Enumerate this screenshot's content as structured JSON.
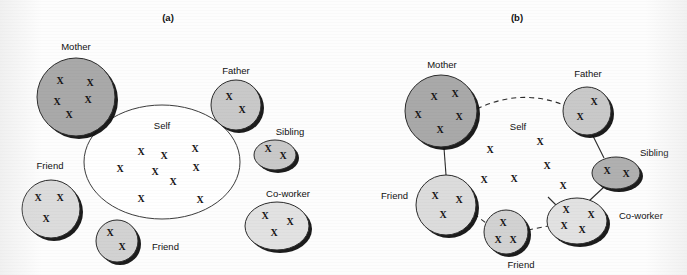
{
  "figure": {
    "panels": [
      {
        "id": "a",
        "title": "(a)",
        "title_pos": {
          "x": 168,
          "y": 21
        },
        "self": {
          "label": "Self",
          "label_pos": {
            "x": 162,
            "y": 129
          },
          "shape": "ellipse",
          "cx": 162,
          "cy": 162,
          "rx": 78,
          "ry": 57,
          "fill": "#ffffff",
          "stroke": "#3c3c3c",
          "x_marks": [
            {
              "x": 141,
              "y": 155
            },
            {
              "x": 164,
              "y": 159
            },
            {
              "x": 195,
              "y": 152
            },
            {
              "x": 120,
              "y": 172
            },
            {
              "x": 155,
              "y": 175
            },
            {
              "x": 196,
              "y": 171
            },
            {
              "x": 173,
              "y": 185
            },
            {
              "x": 141,
              "y": 202
            },
            {
              "x": 200,
              "y": 203
            }
          ]
        },
        "nodes": [
          {
            "name": "mother",
            "label": "Mother",
            "label_pos": {
              "x": 76,
              "y": 50
            },
            "anchor": "middle",
            "shape": "circle",
            "cx": 76,
            "cy": 97,
            "r": 39,
            "fill": "#a9a9a9",
            "stroke": "#2b2b2b",
            "x_marks": [
              {
                "x": 60,
                "y": 84
              },
              {
                "x": 90,
                "y": 86
              },
              {
                "x": 57,
                "y": 105
              },
              {
                "x": 88,
                "y": 103
              },
              {
                "x": 69,
                "y": 118
              }
            ]
          },
          {
            "name": "father",
            "label": "Father",
            "label_pos": {
              "x": 236,
              "y": 74
            },
            "anchor": "middle",
            "shape": "circle",
            "cx": 236,
            "cy": 105,
            "r": 25,
            "fill": "#c9c9c9",
            "stroke": "#2b2b2b",
            "x_marks": [
              {
                "x": 229,
                "y": 100
              },
              {
                "x": 242,
                "y": 113
              }
            ]
          },
          {
            "name": "sibling",
            "label": "Sibling",
            "label_pos": {
              "x": 290,
              "y": 135
            },
            "anchor": "middle",
            "shape": "ellipse",
            "cx": 275,
            "cy": 155,
            "rx": 21,
            "ry": 15,
            "fill": "#c9c9c9",
            "stroke": "#2b2b2b",
            "x_marks": [
              {
                "x": 268,
                "y": 152
              },
              {
                "x": 283,
                "y": 159
              }
            ]
          },
          {
            "name": "friend-left",
            "label": "Friend",
            "label_pos": {
              "x": 50,
              "y": 169
            },
            "anchor": "middle",
            "shape": "circle",
            "cx": 51,
            "cy": 209,
            "r": 29,
            "fill": "#dcdcdc",
            "stroke": "#2b2b2b",
            "x_marks": [
              {
                "x": 38,
                "y": 201
              },
              {
                "x": 60,
                "y": 201
              },
              {
                "x": 46,
                "y": 222
              }
            ]
          },
          {
            "name": "friend-bottom",
            "label": "Friend",
            "label_pos": {
              "x": 152,
              "y": 250
            },
            "anchor": "start",
            "shape": "circle",
            "cx": 117,
            "cy": 241,
            "r": 21,
            "fill": "#d2d2d2",
            "stroke": "#2b2b2b",
            "x_marks": [
              {
                "x": 110,
                "y": 236
              },
              {
                "x": 122,
                "y": 250
              }
            ]
          },
          {
            "name": "co-worker",
            "label": "Co-worker",
            "label_pos": {
              "x": 288,
              "y": 197
            },
            "anchor": "middle",
            "shape": "ellipse",
            "cx": 277,
            "cy": 226,
            "rx": 32,
            "ry": 24,
            "fill": "#e2e2e2",
            "stroke": "#2b2b2b",
            "x_marks": [
              {
                "x": 265,
                "y": 219
              },
              {
                "x": 290,
                "y": 225
              },
              {
                "x": 274,
                "y": 236
              }
            ]
          }
        ],
        "links": []
      },
      {
        "id": "b",
        "title": "(b)",
        "title_pos": {
          "x": 517,
          "y": 21
        },
        "self": {
          "label": "Self",
          "label_pos": {
            "x": 518,
            "y": 130
          },
          "shape": "none",
          "x_marks": [
            {
              "x": 490,
              "y": 153
            },
            {
              "x": 540,
              "y": 145
            },
            {
              "x": 547,
              "y": 169
            },
            {
              "x": 484,
              "y": 183
            },
            {
              "x": 514,
              "y": 182
            },
            {
              "x": 563,
              "y": 189
            }
          ]
        },
        "nodes": [
          {
            "name": "mother",
            "label": "Mother",
            "label_pos": {
              "x": 442,
              "y": 68
            },
            "anchor": "middle",
            "shape": "circle",
            "cx": 441,
            "cy": 111,
            "r": 36,
            "fill": "#a9a9a9",
            "stroke": "#2b2b2b",
            "x_marks": [
              {
                "x": 434,
                "y": 100
              },
              {
                "x": 455,
                "y": 97
              },
              {
                "x": 418,
                "y": 118
              },
              {
                "x": 459,
                "y": 120
              },
              {
                "x": 440,
                "y": 133
              }
            ]
          },
          {
            "name": "father",
            "label": "Father",
            "label_pos": {
              "x": 588,
              "y": 77
            },
            "anchor": "middle",
            "shape": "circle",
            "cx": 587,
            "cy": 111,
            "r": 24,
            "fill": "#c9c9c9",
            "stroke": "#2b2b2b",
            "x_marks": [
              {
                "x": 594,
                "y": 105
              },
              {
                "x": 580,
                "y": 120
              }
            ]
          },
          {
            "name": "sibling",
            "label": "Sibling",
            "label_pos": {
              "x": 640,
              "y": 156
            },
            "anchor": "start",
            "shape": "ellipse",
            "cx": 616,
            "cy": 173,
            "rx": 24,
            "ry": 16,
            "fill": "#b0b0b0",
            "stroke": "#2b2b2b",
            "x_marks": [
              {
                "x": 607,
                "y": 174
              },
              {
                "x": 626,
                "y": 177
              }
            ]
          },
          {
            "name": "friend-left",
            "label": "Friend",
            "label_pos": {
              "x": 408,
              "y": 199
            },
            "anchor": "end",
            "shape": "circle",
            "cx": 446,
            "cy": 205,
            "r": 30,
            "fill": "#dcdcdc",
            "stroke": "#2b2b2b",
            "x_marks": [
              {
                "x": 435,
                "y": 199
              },
              {
                "x": 459,
                "y": 203
              },
              {
                "x": 443,
                "y": 218
              }
            ]
          },
          {
            "name": "friend-bottom",
            "label": "Friend",
            "label_pos": {
              "x": 521,
              "y": 268
            },
            "anchor": "middle",
            "shape": "circle",
            "cx": 506,
            "cy": 232,
            "r": 22,
            "fill": "#d2d2d2",
            "stroke": "#2b2b2b",
            "x_marks": [
              {
                "x": 503,
                "y": 226
              },
              {
                "x": 498,
                "y": 243
              },
              {
                "x": 513,
                "y": 243
              }
            ]
          },
          {
            "name": "co-worker",
            "label": "Co-worker",
            "label_pos": {
              "x": 619,
              "y": 219
            },
            "anchor": "start",
            "shape": "ellipse",
            "cx": 577,
            "cy": 221,
            "rx": 30,
            "ry": 23,
            "fill": "#e2e2e2",
            "stroke": "#2b2b2b",
            "x_marks": [
              {
                "x": 566,
                "y": 213
              },
              {
                "x": 591,
                "y": 218
              },
              {
                "x": 564,
                "y": 229
              },
              {
                "x": 582,
                "y": 233
              }
            ]
          }
        ],
        "links": [
          {
            "name": "mother-father",
            "style": "dashed",
            "d": "M 477 109 Q 520 88 564 105"
          },
          {
            "name": "mother-friend",
            "style": "solid",
            "d": "M 444 148 L 446 175"
          },
          {
            "name": "father-sibling",
            "style": "solid",
            "d": "M 592 134 L 604 158"
          },
          {
            "name": "sibling-coworker",
            "style": "solid",
            "d": "M 604 187 L 589 201"
          },
          {
            "name": "friend-friend",
            "style": "dashed",
            "d": "M 474 214 L 486 223"
          },
          {
            "name": "friendbottom-coworker",
            "style": "dashed",
            "d": "M 528 230 L 548 226"
          },
          {
            "name": "coworker-self",
            "style": "solid",
            "d": "M 556 205 L 548 197"
          }
        ]
      }
    ]
  },
  "marks": {
    "glyph": "X"
  },
  "colors": {
    "background": "#fdfdfd",
    "mother_fill": "#a9a9a9",
    "light_fill": "#dcdcdc",
    "sibling_b_fill": "#b0b0b0",
    "stroke": "#2b2b2b",
    "shadow": "#101010",
    "text": "#111111"
  }
}
